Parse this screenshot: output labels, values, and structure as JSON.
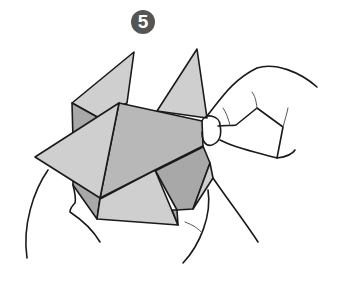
{
  "step": {
    "number": "5"
  },
  "illustration": {
    "subject": "origami-folding-step",
    "description": "Hands holding a folded paper model with triangular flaps, right hand pinching the edge"
  },
  "colors": {
    "badge": "#555555",
    "paper_light": "#cfcfcf",
    "paper_dark": "#a8a8a8",
    "outline": "#1a1a1a"
  }
}
